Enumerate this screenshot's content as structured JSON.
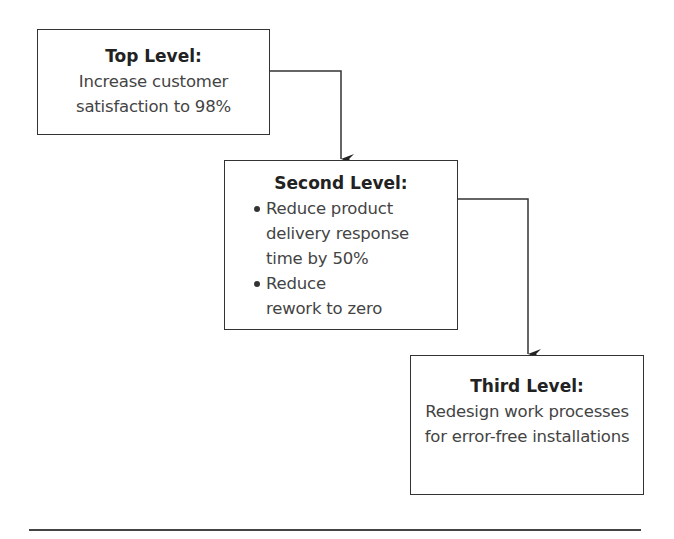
{
  "diagram": {
    "levels": [
      {
        "title": "Top Level:",
        "text": "Increase customer satisfaction to 98%"
      },
      {
        "title": "Second Level:",
        "bullets": [
          "Reduce product delivery response time by 50%",
          "Reduce rework to zero"
        ]
      },
      {
        "title": "Third Level:",
        "text": "Redesign work processes for error-free installations"
      }
    ],
    "connectors": [
      {
        "from": "Top Level",
        "to": "Second Level"
      },
      {
        "from": "Second Level",
        "to": "Third Level"
      }
    ]
  }
}
